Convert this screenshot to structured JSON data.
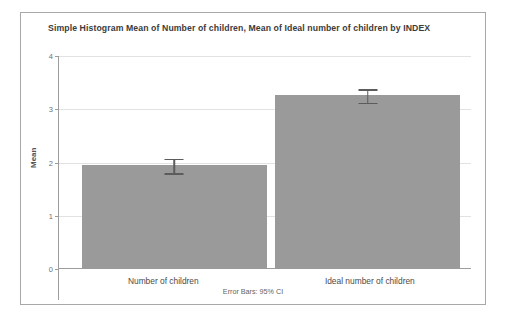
{
  "chart_data": {
    "type": "bar",
    "title": "Simple Histogram Mean of Number of children, Mean of Ideal number of children by INDEX",
    "xlabel": "",
    "ylabel": "Mean",
    "categories": [
      "Number of children",
      "Ideal number of children"
    ],
    "values": [
      1.96,
      3.27
    ],
    "error_bars": {
      "type": "95% CI",
      "lower": [
        1.8,
        3.12
      ],
      "upper": [
        2.07,
        3.38
      ]
    },
    "ylim": [
      0,
      4.25
    ],
    "yticks": [
      "0",
      "1",
      "2",
      "3",
      "4"
    ],
    "ytick_values": [
      0,
      1,
      2,
      3,
      4
    ],
    "grid": true,
    "legend": "none",
    "footnote": "Error Bars: 95% CI",
    "bar_color": "#9a9a9a",
    "error_bar_color": "#5c5c5c",
    "gridline_color": "#e2e2e2",
    "axis_color": "#9d9d9d",
    "frame_color": "#a8a8a8",
    "background": "#ffffff"
  }
}
